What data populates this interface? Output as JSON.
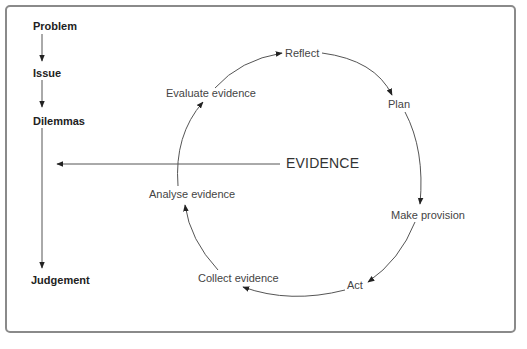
{
  "diagram": {
    "left_sequence": [
      {
        "label": "Problem"
      },
      {
        "label": "Issue"
      },
      {
        "label": "Dilemmas"
      },
      {
        "label": "Judgement"
      }
    ],
    "central_label": "EVIDENCE",
    "cycle": [
      {
        "label": "Reflect"
      },
      {
        "label": "Plan"
      },
      {
        "label": "Make provision"
      },
      {
        "label": "Act"
      },
      {
        "label": "Collect evidence"
      },
      {
        "label": "Analyse evidence"
      },
      {
        "label": "Evaluate evidence"
      }
    ],
    "colors": {
      "frame": "#8a8a8a",
      "line": "#555555",
      "text": "#444444",
      "bold_text": "#222222"
    }
  }
}
